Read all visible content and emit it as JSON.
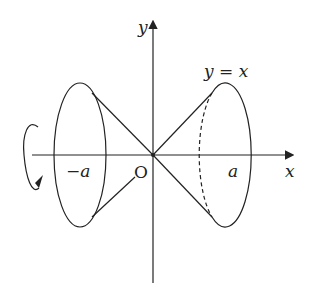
{
  "diagram": {
    "type": "solid-of-revolution",
    "labels": {
      "y_axis": "y",
      "x_axis": "x",
      "origin": "O",
      "curve": "y = x",
      "neg_a": "−a",
      "pos_a": "a"
    },
    "colors": {
      "stroke": "#222222",
      "background": "#ffffff"
    }
  }
}
